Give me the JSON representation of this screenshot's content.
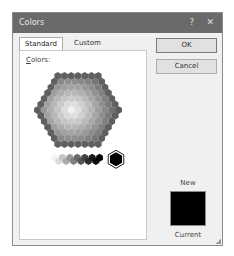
{
  "window": {
    "title": "Colors",
    "help_label": "?",
    "close_label": "✕"
  },
  "tabs": [
    {
      "label": "Standard",
      "active": true
    },
    {
      "label": "Custom",
      "active": false
    }
  ],
  "panel": {
    "colors_label_accel": "C",
    "colors_label_rest": "olors:"
  },
  "buttons": {
    "ok": "OK",
    "cancel": "Cancel"
  },
  "preview": {
    "new_label": "New",
    "current_label": "Current",
    "new_color": "#000000"
  },
  "palette": {
    "mode": "grayscale-rendered",
    "hex_rows": [
      7,
      8,
      9,
      10,
      11,
      12,
      13,
      12,
      11,
      10,
      9,
      8,
      7
    ],
    "gray_row": [
      "#f4f4f4",
      "#dcdcdc",
      "#c4c4c4",
      "#acacac",
      "#969696",
      "#808080",
      "#6a6a6a",
      "#555555",
      "#404040",
      "#2c2c2c",
      "#1a1a1a",
      "#0c0c0c",
      "#050505"
    ],
    "selected_color": "#000000"
  }
}
